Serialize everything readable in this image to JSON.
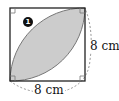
{
  "figure": {
    "badge_number": "1",
    "side_label_right": "8 cm",
    "side_label_bottom": "8 cm",
    "colors": {
      "square_stroke": "#222222",
      "lens_fill": "#cccccc",
      "lens_stroke": "#777777",
      "dashed_arc": "#888888",
      "badge_bg": "#111111"
    }
  }
}
